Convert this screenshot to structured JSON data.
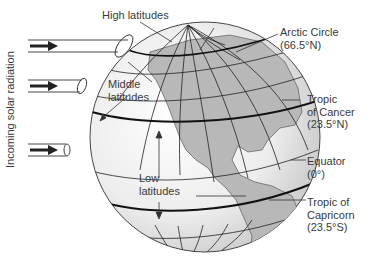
{
  "diagram": {
    "side_label": "Incoming solar radiation",
    "zones": {
      "high": "High latitudes",
      "middle_line1": "Middle",
      "middle_line2": "latitudes",
      "low_line1": "Low",
      "low_line2": "latitudes"
    },
    "circles": {
      "arctic_name": "Arctic Circle",
      "arctic_deg": "(66.5°N)",
      "cancer_line1": "Tropic",
      "cancer_line2": "of Cancer",
      "cancer_deg": "(23.5°N)",
      "equator_name": "Equator",
      "equator_deg": "(0°)",
      "capricorn_line1": "Tropic of",
      "capricorn_line2": "Capricorn",
      "capricorn_deg": "(23.5°S)"
    },
    "colors": {
      "globe_light": "#f7f7f7",
      "globe_shade": "#cfcfcf",
      "land": "#b8b8b8",
      "line": "#222222",
      "text": "#3a3a3a"
    }
  }
}
